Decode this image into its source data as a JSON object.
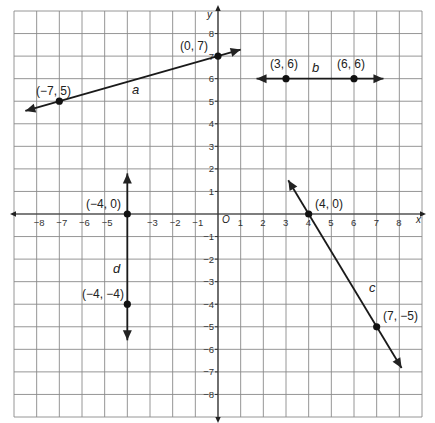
{
  "chart_data": {
    "type": "line",
    "title": "",
    "xlabel": "x",
    "ylabel": "y",
    "origin_label": "O",
    "xlim": [
      -9,
      9
    ],
    "ylim": [
      -9,
      9
    ],
    "grid": true,
    "x_ticks": [
      -8,
      -7,
      -6,
      -5,
      -3,
      -2,
      -1,
      1,
      2,
      3,
      4,
      5,
      6,
      7,
      8
    ],
    "x_tick_labels": [
      "−8",
      "−7",
      "−6",
      "−5",
      "−3",
      "−2",
      "−1",
      "1",
      "2",
      "3",
      "4",
      "5",
      "6",
      "7",
      "8"
    ],
    "y_ticks": [
      8,
      7,
      6,
      5,
      4,
      3,
      2,
      1,
      -1,
      -2,
      -3,
      -4,
      -5,
      -6,
      -7,
      -8
    ],
    "y_tick_labels": [
      "8",
      "7",
      "6",
      "5",
      "4",
      "3",
      "2",
      "1",
      "−1",
      "−2",
      "−3",
      "−4",
      "−5",
      "−6",
      "−7",
      "−8"
    ],
    "series": [
      {
        "name": "a",
        "points": [
          {
            "x": -7,
            "y": 5,
            "label": "(−7, 5)"
          },
          {
            "x": 0,
            "y": 7,
            "label": "(0, 7)"
          }
        ],
        "extent": [
          [
            -8.5,
            4.57
          ],
          [
            1,
            7.29
          ]
        ],
        "arrows": "both"
      },
      {
        "name": "b",
        "points": [
          {
            "x": 3,
            "y": 6,
            "label": "(3, 6)"
          },
          {
            "x": 6,
            "y": 6,
            "label": "(6, 6)"
          }
        ],
        "extent": [
          [
            1.7,
            6
          ],
          [
            7.3,
            6
          ]
        ],
        "arrows": "both"
      },
      {
        "name": "c",
        "points": [
          {
            "x": 4,
            "y": 0,
            "label": "(4, 0)"
          },
          {
            "x": 7,
            "y": -5,
            "label": "(7, −5)"
          }
        ],
        "extent": [
          [
            3.1,
            1.5
          ],
          [
            8.1,
            -6.83
          ]
        ],
        "arrows": "both"
      },
      {
        "name": "d",
        "points": [
          {
            "x": -4,
            "y": 0,
            "label": "(−4, 0)"
          },
          {
            "x": -4,
            "y": -4,
            "label": "(−4, −4)"
          }
        ],
        "extent": [
          [
            -4,
            1.8
          ],
          [
            -4,
            -5.6
          ]
        ],
        "arrows": "both"
      }
    ]
  },
  "line_labels": {
    "a": "a",
    "b": "b",
    "c": "c",
    "d": "d"
  },
  "point_labels": {
    "a1": "(−7, 5)",
    "a2": "(0, 7)",
    "b1": "(3, 6)",
    "b2": "(6, 6)",
    "c1": "(4, 0)",
    "c2": "(7, −5)",
    "d1": "(−4, 0)",
    "d2": "(−4, −4)"
  },
  "axis": {
    "x": "x",
    "y": "y",
    "origin": "O"
  }
}
